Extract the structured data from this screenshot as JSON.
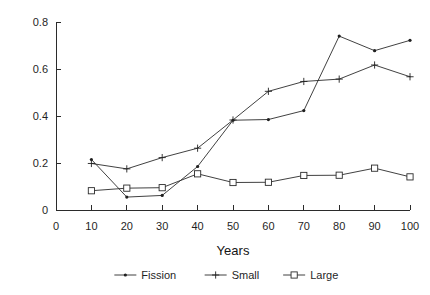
{
  "chart_data": {
    "type": "line",
    "title": "",
    "subtitle": "",
    "xlabel": "Years",
    "ylabel": "",
    "xlim": [
      0,
      100
    ],
    "ylim": [
      0,
      0.8
    ],
    "grid": false,
    "legend_position": "bottom-center",
    "x": [
      10,
      20,
      30,
      40,
      50,
      60,
      70,
      80,
      90,
      100
    ],
    "xticks": [
      "0",
      "10",
      "20",
      "30",
      "40",
      "50",
      "60",
      "70",
      "80",
      "90",
      "100"
    ],
    "xtick_values": [
      0,
      10,
      20,
      30,
      40,
      50,
      60,
      70,
      80,
      90,
      100
    ],
    "yticks": [
      "0",
      "0.2",
      "0.4",
      "0.6",
      "0.8"
    ],
    "ytick_values": [
      0,
      0.2,
      0.4,
      0.6,
      0.8
    ],
    "series": [
      {
        "name": "Fission",
        "marker": "dot",
        "color": "#202020",
        "values": [
          0.215,
          0.055,
          0.062,
          0.185,
          0.382,
          0.385,
          0.423,
          0.74,
          0.678,
          0.722
        ]
      },
      {
        "name": "Small",
        "marker": "plus",
        "color": "#202020",
        "values": [
          0.198,
          0.175,
          0.223,
          0.263,
          0.383,
          0.505,
          0.547,
          0.557,
          0.617,
          0.567
        ]
      },
      {
        "name": "Large",
        "marker": "square",
        "color": "#202020",
        "values": [
          0.082,
          0.093,
          0.095,
          0.154,
          0.117,
          0.118,
          0.147,
          0.148,
          0.178,
          0.141
        ]
      }
    ]
  },
  "axes": {
    "x_title": "Years",
    "y_title": ""
  },
  "legend": {
    "items": [
      {
        "label": "Fission",
        "marker": "dot"
      },
      {
        "label": "Small",
        "marker": "plus"
      },
      {
        "label": "Large",
        "marker": "square"
      }
    ]
  },
  "colors": {
    "background": "#ffffff",
    "ink": "#2b2b2b",
    "text": "#1f1f1f"
  }
}
